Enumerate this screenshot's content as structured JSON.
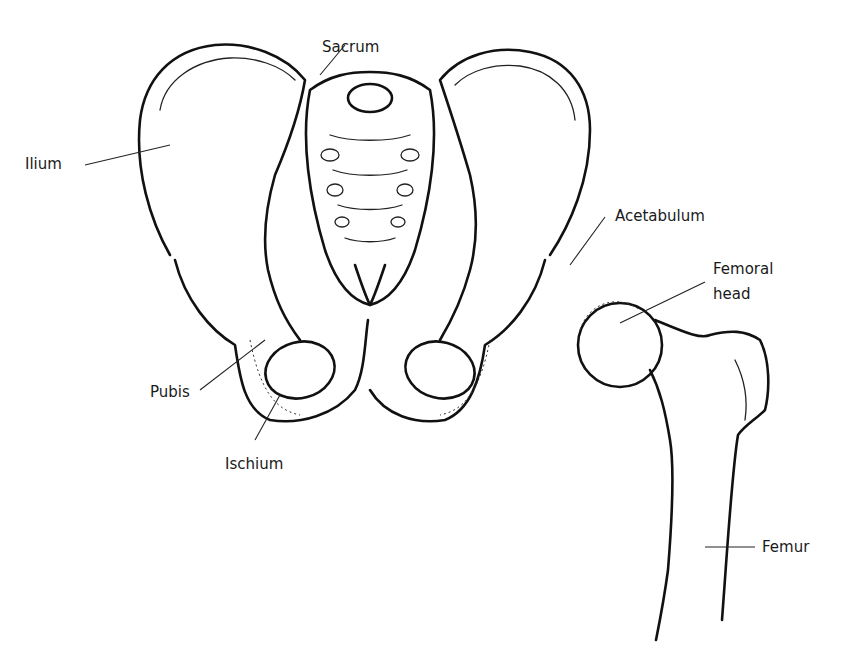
{
  "diagram": {
    "labels": [
      {
        "id": "ilium",
        "text": "Ilium"
      },
      {
        "id": "sacrum",
        "text": "Sacrum"
      },
      {
        "id": "acetabulum",
        "text": "Acetabulum"
      },
      {
        "id": "femoral_head_line1",
        "text": "Femoral"
      },
      {
        "id": "femoral_head_line2",
        "text": "head"
      },
      {
        "id": "pubis",
        "text": "Pubis"
      },
      {
        "id": "ischium",
        "text": "Ischium"
      },
      {
        "id": "femur",
        "text": "Femur"
      }
    ]
  }
}
